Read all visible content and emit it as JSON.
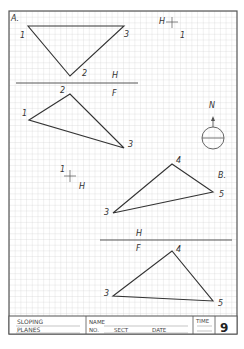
{
  "worksheet": {
    "section_a_label": "A.",
    "section_b_label": "B.",
    "sheet_number": "9"
  },
  "title_block": {
    "title_line1": "SLOPING",
    "title_line2": "PLANES",
    "name_label": "NAME",
    "no_label": "NO.",
    "sect_label": "SECT",
    "date_label": "DATE",
    "time_label": "TIME",
    "sheet_number": "9"
  },
  "part_a": {
    "top_view": {
      "plane_label": "H",
      "points": [
        {
          "id": "1",
          "x": 28,
          "y": 26
        },
        {
          "id": "2",
          "x": 70,
          "y": 76
        },
        {
          "id": "3",
          "x": 124,
          "y": 26
        }
      ]
    },
    "fold_line": {
      "upper": "H",
      "lower": "F"
    },
    "front_view": {
      "points": [
        {
          "id": "1",
          "x": 29,
          "y": 120
        },
        {
          "id": "2",
          "x": 70,
          "y": 94
        },
        {
          "id": "3",
          "x": 124,
          "y": 148
        }
      ]
    },
    "reference_cross_top": {
      "h_label": "H",
      "one_label": "1"
    },
    "reference_cross_mid": {
      "one_label": "1",
      "h_label": "H"
    }
  },
  "part_b": {
    "top_view": {
      "points": [
        {
          "id": "3",
          "x": 113,
          "y": 213
        },
        {
          "id": "4",
          "x": 172,
          "y": 164
        },
        {
          "id": "5",
          "x": 213,
          "y": 192
        }
      ]
    },
    "fold_line": {
      "upper": "H",
      "lower": "F"
    },
    "front_view": {
      "points": [
        {
          "id": "3",
          "x": 113,
          "y": 296
        },
        {
          "id": "4",
          "x": 172,
          "y": 251
        },
        {
          "id": "5",
          "x": 213,
          "y": 301
        }
      ]
    }
  },
  "compass": {
    "north_label": "N"
  },
  "colors": {
    "grid": "#c8c8c8",
    "ink": "#333333",
    "border": "#555555"
  }
}
